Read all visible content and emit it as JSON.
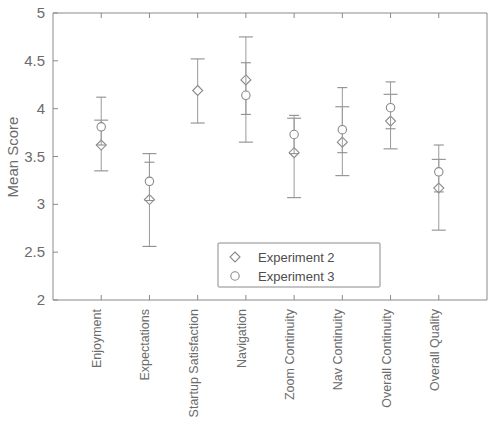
{
  "chart_data": {
    "type": "scatter",
    "title": "",
    "xlabel": "",
    "ylabel": "Mean Score",
    "ylim": [
      2,
      5
    ],
    "yticks": [
      2,
      2.5,
      3,
      3.5,
      4,
      4.5,
      5
    ],
    "ytick_labels": [
      "2",
      "2.5",
      "3",
      "3.5",
      "4",
      "4.5",
      "5"
    ],
    "grid": false,
    "legend_position": "lower right",
    "error_bars": "error bars with caps (confidence interval)",
    "categories": [
      "Enjoyment",
      "Expectations",
      "Startup Satisfaction",
      "Navigation",
      "Zoom Continuity",
      "Nav Continuity",
      "Overall Continuity",
      "Overall Quality"
    ],
    "series": [
      {
        "name": "Experiment 2",
        "marker": "diamond",
        "values": [
          3.62,
          3.05,
          4.19,
          4.3,
          3.54,
          3.65,
          3.87,
          3.17
        ],
        "err_low": [
          3.35,
          2.56,
          3.85,
          3.65,
          3.07,
          3.3,
          3.58,
          2.73
        ],
        "err_high": [
          3.88,
          3.53,
          4.52,
          4.75,
          3.9,
          4.02,
          4.15,
          3.47
        ]
      },
      {
        "name": "Experiment 3",
        "marker": "circle",
        "values": [
          3.81,
          3.24,
          null,
          4.14,
          3.73,
          3.78,
          4.01,
          3.34
        ],
        "err_low": [
          3.62,
          3.04,
          null,
          3.94,
          3.53,
          3.54,
          3.79,
          3.13
        ],
        "err_high": [
          4.12,
          3.44,
          null,
          4.48,
          3.93,
          4.22,
          4.28,
          3.62
        ]
      }
    ]
  },
  "axis": {
    "y_title": "Mean Score"
  },
  "legend": {
    "entries": [
      {
        "label": "Experiment 2",
        "marker": "diamond"
      },
      {
        "label": "Experiment 3",
        "marker": "circle"
      }
    ]
  },
  "colors": {
    "axis": "#8a8a8a",
    "marker_stroke": "#8a8a8a",
    "marker_fill": "#ffffff",
    "text": "#6b6b6b",
    "background": "#ffffff"
  }
}
